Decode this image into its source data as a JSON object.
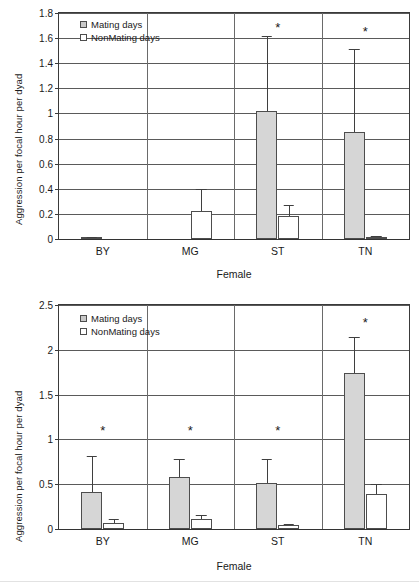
{
  "figure": {
    "panels": [
      "top",
      "bottom"
    ]
  },
  "legend": {
    "mating_label": "Mating days",
    "nonmating_label": "NonMating days",
    "mating_swatch": "mating-swatch-icon",
    "nonmating_swatch": "nonmating-swatch-icon",
    "mating_color": "#d6d6d6",
    "nonmating_color": "#ffffff",
    "border_color": "#4d4d4d",
    "position": "top-left inside plot"
  },
  "axes": {
    "ylabel": "Aggression per focal hour per dyad",
    "xlabel": "Female"
  },
  "significance_marker": "*",
  "chart_data": [
    {
      "type": "bar",
      "panel": "top",
      "title": "",
      "xlabel": "Female",
      "ylabel": "Aggression per focal hour per dyad",
      "categories": [
        "BY",
        "MG",
        "ST",
        "TN"
      ],
      "ylim": [
        0,
        1.8
      ],
      "yticks": [
        "0",
        "0.2",
        "0.4",
        "0.6",
        "0.8",
        "1",
        "1.2",
        "1.4",
        "1.6",
        "1.8"
      ],
      "ytick_values": [
        0,
        0.2,
        0.4,
        0.6,
        0.8,
        1.0,
        1.2,
        1.4,
        1.6,
        1.8
      ],
      "grid": true,
      "legend_position": "upper left",
      "series": [
        {
          "name": "Mating days",
          "color": "#d6d6d6",
          "values": [
            0.008,
            0,
            1.02,
            0.855
          ],
          "errors_upper": [
            0.012,
            0,
            1.62,
            1.51
          ]
        },
        {
          "name": "NonMating days",
          "color": "#ffffff",
          "values": [
            0.0,
            0.22,
            0.18,
            0.015
          ],
          "errors_upper": [
            0.0,
            0.4,
            0.27,
            0.022
          ]
        }
      ],
      "annotations": [
        {
          "category": "ST",
          "text": "*",
          "y": 1.69
        },
        {
          "category": "TN",
          "text": "*",
          "y": 1.66
        }
      ]
    },
    {
      "type": "bar",
      "panel": "bottom",
      "title": "",
      "xlabel": "Female",
      "ylabel": "Aggression per focal hour per dyad",
      "categories": [
        "BY",
        "MG",
        "ST",
        "TN"
      ],
      "ylim": [
        0,
        2.5
      ],
      "yticks": [
        "0",
        "0.5",
        "1",
        "1.5",
        "2",
        "2.5"
      ],
      "ytick_values": [
        0,
        0.5,
        1.0,
        1.5,
        2.0,
        2.5
      ],
      "grid": true,
      "legend_position": "upper left",
      "series": [
        {
          "name": "Mating days",
          "color": "#d6d6d6",
          "values": [
            0.41,
            0.575,
            0.51,
            1.74
          ],
          "errors_upper": [
            0.81,
            0.78,
            0.78,
            2.14
          ]
        },
        {
          "name": "NonMating days",
          "color": "#ffffff",
          "values": [
            0.07,
            0.11,
            0.04,
            0.39
          ],
          "errors_upper": [
            0.115,
            0.155,
            0.055,
            0.5
          ]
        }
      ],
      "annotations": [
        {
          "category": "BY",
          "text": "*",
          "y": 1.1
        },
        {
          "category": "MG",
          "text": "*",
          "y": 1.1
        },
        {
          "category": "ST",
          "text": "*",
          "y": 1.1
        },
        {
          "category": "TN",
          "text": "*",
          "y": 2.31
        }
      ]
    }
  ]
}
